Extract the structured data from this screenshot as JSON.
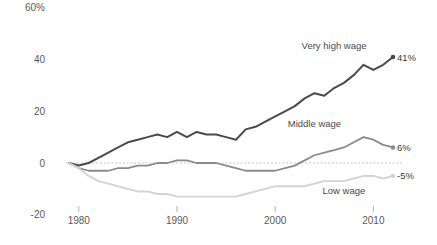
{
  "chart_data": {
    "type": "line",
    "title": "",
    "subtitle": "",
    "xlabel": "",
    "ylabel": "",
    "xlim": [
      1977,
      2013
    ],
    "ylim": [
      -20,
      60
    ],
    "grid": false,
    "zero_reference_line": true,
    "legend_position": "inline-right",
    "y_ticks": [
      {
        "value": 60,
        "label": "60%"
      },
      {
        "value": 40,
        "label": "40"
      },
      {
        "value": 20,
        "label": "20"
      },
      {
        "value": 0,
        "label": "0"
      },
      {
        "value": -20,
        "label": "-20"
      }
    ],
    "x_ticks": [
      {
        "value": 1980,
        "label": "1980"
      },
      {
        "value": 1990,
        "label": "1990"
      },
      {
        "value": 2000,
        "label": "2000"
      },
      {
        "value": 2010,
        "label": "2010"
      }
    ],
    "x": [
      1979,
      1980,
      1981,
      1982,
      1983,
      1984,
      1985,
      1986,
      1987,
      1988,
      1989,
      1990,
      1991,
      1992,
      1993,
      1994,
      1995,
      1996,
      1997,
      1998,
      1999,
      2000,
      2001,
      2002,
      2003,
      2004,
      2005,
      2006,
      2007,
      2008,
      2009,
      2010,
      2011,
      2012
    ],
    "series": [
      {
        "name": "Very high wage",
        "color": "#4a4a4a",
        "width": 2.0,
        "end_label": "41%",
        "end_value": 41,
        "label_x": 2006,
        "label_y": 44,
        "values": [
          0,
          -1,
          0,
          2,
          4,
          6,
          8,
          9,
          10,
          11,
          10,
          12,
          10,
          12,
          11,
          11,
          10,
          9,
          13,
          14,
          16,
          18,
          20,
          22,
          25,
          27,
          26,
          29,
          31,
          34,
          38,
          36,
          38,
          41
        ]
      },
      {
        "name": "Middle wage",
        "color": "#8a8a8a",
        "width": 1.8,
        "end_label": "6%",
        "end_value": 6,
        "label_x": 2004,
        "label_y": 14,
        "values": [
          0,
          -2,
          -3,
          -3,
          -3,
          -2,
          -2,
          -1,
          -1,
          0,
          0,
          1,
          1,
          0,
          0,
          0,
          -1,
          -2,
          -3,
          -3,
          -3,
          -3,
          -2,
          -1,
          1,
          3,
          4,
          5,
          6,
          8,
          10,
          9,
          7,
          6
        ]
      },
      {
        "name": "Low wage",
        "color": "#d4d4d4",
        "width": 1.9,
        "end_label": "-5%",
        "end_value": -5,
        "label_x": 2007,
        "label_y": -12,
        "values": [
          0,
          -2,
          -5,
          -7,
          -8,
          -9,
          -10,
          -11,
          -11,
          -12,
          -12,
          -13,
          -13,
          -13,
          -13,
          -13,
          -13,
          -13,
          -12,
          -11,
          -10,
          -9,
          -9,
          -9,
          -9,
          -8,
          -7,
          -7,
          -7,
          -6,
          -5,
          -5,
          -6,
          -5
        ]
      }
    ]
  }
}
